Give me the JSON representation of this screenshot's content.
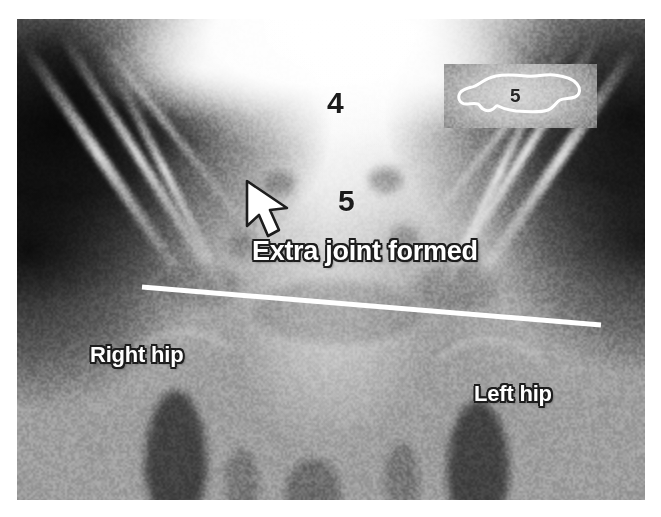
{
  "figure": {
    "modality": "x-ray-radiograph",
    "view": "anteroposterior-pelvis",
    "caption": ""
  },
  "annotations": {
    "vertebra_l4": {
      "label": "4",
      "meaning": "lumbar-vertebra-4",
      "color": "#1b1b1b"
    },
    "vertebra_l5": {
      "label": "5",
      "meaning": "lumbar-vertebra-5",
      "color": "#1b1b1b"
    },
    "extra_joint": {
      "label": "Extra joint formed",
      "color": "#ffffff",
      "outline_color": "#1d1d1d"
    },
    "right_hip": {
      "label": "Right hip",
      "color": "#ffffff",
      "outline_color": "#1d1d1d"
    },
    "left_hip": {
      "label": "Left hip",
      "color": "#ffffff",
      "outline_color": "#1d1d1d"
    },
    "pointer": {
      "name": "arrow-pointing-to-extra-joint",
      "direction": "up-left",
      "fill": "#ffffff",
      "stroke": "#1d1d1d"
    },
    "measurement_line": {
      "name": "pelvic-reference-line",
      "color": "#ffffff",
      "x1": 142,
      "y1": 287,
      "x2": 601,
      "y2": 325,
      "width": 5
    }
  },
  "inset": {
    "name": "magnified-vertebra-inset",
    "label": "5",
    "label_color": "#242424",
    "outline_color": "#ffffff",
    "position": {
      "left": 444,
      "top": 64,
      "width": 153,
      "height": 64
    }
  },
  "plate": {
    "left": 17,
    "top": 19,
    "width": 628,
    "height": 481,
    "background_color": "#8a8a8a",
    "page_background": "#ffffff"
  }
}
